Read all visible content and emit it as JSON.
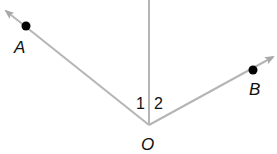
{
  "diagram": {
    "colors": {
      "line": "#b5b5b5",
      "point": "#000000",
      "text": "#111111",
      "background": "#ffffff"
    },
    "vertex": {
      "label": "O",
      "x": 149,
      "y": 125
    },
    "points": [
      {
        "label": "A",
        "x": 26,
        "y": 26
      },
      {
        "label": "B",
        "x": 253,
        "y": 70
      }
    ],
    "angles": [
      {
        "label": "1"
      },
      {
        "label": "2"
      }
    ]
  }
}
